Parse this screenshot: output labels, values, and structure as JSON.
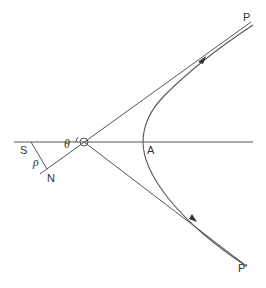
{
  "diagram": {
    "type": "hyperbolic trajectory (Rutherford scattering geometry)",
    "labels": {
      "P": "P",
      "P_prime": "P'",
      "A": "A",
      "S": "S",
      "N": "N",
      "rho": "ρ",
      "theta": "θ"
    },
    "elements": [
      {
        "name": "horizontal-axis",
        "description": "Horizontal line through S, O, and A"
      },
      {
        "name": "origin-circle",
        "label": "O",
        "description": "Small circle at intersection of asymptotes"
      },
      {
        "name": "asymptote-upper",
        "description": "Straight line from lower-left (N side) through O up to P"
      },
      {
        "name": "asymptote-lower",
        "description": "Straight line from O down to P'"
      },
      {
        "name": "perpendicular-SN",
        "description": "Segment from S perpendicular to the asymptote, length ρ"
      },
      {
        "name": "hyperbola-branch",
        "description": "Curved path from P through vertex A to P'"
      },
      {
        "name": "arrow-incoming",
        "description": "Direction arrow on incoming branch near P"
      },
      {
        "name": "arrow-outgoing",
        "description": "Direction arrow on outgoing branch near P'"
      }
    ],
    "colors": {
      "stroke": "#555555",
      "text": "#333333",
      "background": "#ffffff"
    }
  }
}
